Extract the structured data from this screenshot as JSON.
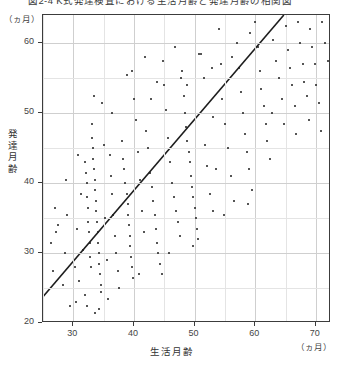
{
  "title": "図2-4  K式発達検査における生活月齢と発達月齢の相関図",
  "axes": {
    "x_label": "生活月齢",
    "x_unit": "（ヵ月）",
    "y_label": "発達月齢",
    "y_unit": "（ヵ月）",
    "x_ticks": [
      "30",
      "40",
      "50",
      "60",
      "70"
    ],
    "y_ticks": [
      "60",
      "50",
      "40",
      "30",
      "20"
    ]
  },
  "chart_data": {
    "type": "scatter",
    "title": "図2-4  K式発達検査における生活月齢と発達月齢の相関図",
    "xlabel": "生活月齢",
    "ylabel": "発達月齢",
    "x_unit": "ヵ月",
    "y_unit": "ヵ月",
    "xlim": [
      25,
      72.5
    ],
    "ylim": [
      20,
      64
    ],
    "xticks": [
      30,
      40,
      50,
      60,
      70
    ],
    "yticks": [
      20,
      30,
      40,
      50,
      60
    ],
    "grid": true,
    "grid_step_x": 5,
    "grid_step_y": 5,
    "legend": "none",
    "series": [
      {
        "name": "被検児",
        "marker": "dot",
        "color": "#1d1d1d",
        "points": [
          [
            26.3,
            31.5
          ],
          [
            26.6,
            27.5
          ],
          [
            27.0,
            36.5
          ],
          [
            27.2,
            33.0
          ],
          [
            28.3,
            25.5
          ],
          [
            28.6,
            30.0
          ],
          [
            29.0,
            35.5
          ],
          [
            29.4,
            22.5
          ],
          [
            30.2,
            28.0
          ],
          [
            30.6,
            33.5
          ],
          [
            31.0,
            26.0
          ],
          [
            31.2,
            38.5
          ],
          [
            31.6,
            30.5
          ],
          [
            31.9,
            24.0
          ],
          [
            32.0,
            43.0
          ],
          [
            32.1,
            41.5
          ],
          [
            32.2,
            40.0
          ],
          [
            32.3,
            38.0
          ],
          [
            32.4,
            36.5
          ],
          [
            32.5,
            34.5
          ],
          [
            32.6,
            33.0
          ],
          [
            32.7,
            31.5
          ],
          [
            32.8,
            29.5
          ],
          [
            32.9,
            28.0
          ],
          [
            33.0,
            48.5
          ],
          [
            33.1,
            46.5
          ],
          [
            33.2,
            45.0
          ],
          [
            33.3,
            43.5
          ],
          [
            33.4,
            42.0
          ],
          [
            33.5,
            40.5
          ],
          [
            33.6,
            39.0
          ],
          [
            33.7,
            37.5
          ],
          [
            33.8,
            36.0
          ],
          [
            33.9,
            34.5
          ],
          [
            34.0,
            33.0
          ],
          [
            34.1,
            31.5
          ],
          [
            34.2,
            30.0
          ],
          [
            34.3,
            28.5
          ],
          [
            34.4,
            27.0
          ],
          [
            34.5,
            25.5
          ],
          [
            34.6,
            24.5
          ],
          [
            35.0,
            45.5
          ],
          [
            35.3,
            35.0
          ],
          [
            35.6,
            29.0
          ],
          [
            36.0,
            44.0
          ],
          [
            36.2,
            41.0
          ],
          [
            36.4,
            38.5
          ],
          [
            36.6,
            35.5
          ],
          [
            36.8,
            32.5
          ],
          [
            37.0,
            30.0
          ],
          [
            37.3,
            27.5
          ],
          [
            37.6,
            25.0
          ],
          [
            38.0,
            46.0
          ],
          [
            38.2,
            43.5
          ],
          [
            38.4,
            42.0
          ],
          [
            38.6,
            40.0
          ],
          [
            38.8,
            38.5
          ],
          [
            39.0,
            37.0
          ],
          [
            39.1,
            35.5
          ],
          [
            39.2,
            34.0
          ],
          [
            39.3,
            32.5
          ],
          [
            39.4,
            31.0
          ],
          [
            39.5,
            29.5
          ],
          [
            39.6,
            28.0
          ],
          [
            39.8,
            26.5
          ],
          [
            40.0,
            52.0
          ],
          [
            40.3,
            49.0
          ],
          [
            40.6,
            44.5
          ],
          [
            41.0,
            40.5
          ],
          [
            41.3,
            36.0
          ],
          [
            41.6,
            33.0
          ],
          [
            42.0,
            47.5
          ],
          [
            42.3,
            45.0
          ],
          [
            42.6,
            41.5
          ],
          [
            43.0,
            39.5
          ],
          [
            43.2,
            37.5
          ],
          [
            43.4,
            35.5
          ],
          [
            43.6,
            33.5
          ],
          [
            43.8,
            31.5
          ],
          [
            44.0,
            30.0
          ],
          [
            44.3,
            28.5
          ],
          [
            44.6,
            27.0
          ],
          [
            45.0,
            54.0
          ],
          [
            45.3,
            50.5
          ],
          [
            45.6,
            46.5
          ],
          [
            46.0,
            43.0
          ],
          [
            46.3,
            40.0
          ],
          [
            46.6,
            38.0
          ],
          [
            47.0,
            36.0
          ],
          [
            47.3,
            34.5
          ],
          [
            47.6,
            32.5
          ],
          [
            48.0,
            56.0
          ],
          [
            48.2,
            52.5
          ],
          [
            48.4,
            50.0
          ],
          [
            48.6,
            48.0
          ],
          [
            48.8,
            46.0
          ],
          [
            49.0,
            44.5
          ],
          [
            49.2,
            43.0
          ],
          [
            49.4,
            41.0
          ],
          [
            49.6,
            39.5
          ],
          [
            49.8,
            38.0
          ],
          [
            50.0,
            36.5
          ],
          [
            50.2,
            35.0
          ],
          [
            50.4,
            33.5
          ],
          [
            50.6,
            32.0
          ],
          [
            51.0,
            58.5
          ],
          [
            51.5,
            55.0
          ],
          [
            52.0,
            42.5
          ],
          [
            52.5,
            38.5
          ],
          [
            53.0,
            36.0
          ],
          [
            53.5,
            42.0
          ],
          [
            54.0,
            62.0
          ],
          [
            54.3,
            57.0
          ],
          [
            54.6,
            52.0
          ],
          [
            55.0,
            48.5
          ],
          [
            55.5,
            45.0
          ],
          [
            56.0,
            41.0
          ],
          [
            56.5,
            37.5
          ],
          [
            57.0,
            60.0
          ],
          [
            57.3,
            56.5
          ],
          [
            57.6,
            53.0
          ],
          [
            58.0,
            50.0
          ],
          [
            58.3,
            47.0
          ],
          [
            58.6,
            44.5
          ],
          [
            59.0,
            42.0
          ],
          [
            59.5,
            39.0
          ],
          [
            60.0,
            63.0
          ],
          [
            60.4,
            59.5
          ],
          [
            60.8,
            56.0
          ],
          [
            61.0,
            53.5
          ],
          [
            61.4,
            51.0
          ],
          [
            61.8,
            48.5
          ],
          [
            62.0,
            46.0
          ],
          [
            62.5,
            43.5
          ],
          [
            63.0,
            60.5
          ],
          [
            63.5,
            57.5
          ],
          [
            64.0,
            55.0
          ],
          [
            64.5,
            52.0
          ],
          [
            65.0,
            62.5
          ],
          [
            65.4,
            59.0
          ],
          [
            65.8,
            56.5
          ],
          [
            66.0,
            54.0
          ],
          [
            66.5,
            51.0
          ],
          [
            67.0,
            63.0
          ],
          [
            67.4,
            60.0
          ],
          [
            67.8,
            57.0
          ],
          [
            68.0,
            54.5
          ],
          [
            68.5,
            52.5
          ],
          [
            69.0,
            62.0
          ],
          [
            69.4,
            59.5
          ],
          [
            69.8,
            57.0
          ],
          [
            70.0,
            54.0
          ],
          [
            70.5,
            51.5
          ],
          [
            71.0,
            63.0
          ],
          [
            71.5,
            60.0
          ],
          [
            72.0,
            57.5
          ],
          [
            53.0,
            49.5
          ],
          [
            51.8,
            45.5
          ],
          [
            47.8,
            55.0
          ],
          [
            44.8,
            57.5
          ],
          [
            42.8,
            52.0
          ],
          [
            38.8,
            55.5
          ],
          [
            36.4,
            50.0
          ],
          [
            34.8,
            51.5
          ],
          [
            33.4,
            52.5
          ],
          [
            30.8,
            44.0
          ],
          [
            28.8,
            40.5
          ],
          [
            27.4,
            34.0
          ],
          [
            59.2,
            61.5
          ],
          [
            56.2,
            58.0
          ],
          [
            50.8,
            58.5
          ],
          [
            46.8,
            59.5
          ],
          [
            41.8,
            58.0
          ],
          [
            39.6,
            56.0
          ],
          [
            43.8,
            54.5
          ],
          [
            48.8,
            54.0
          ],
          [
            52.8,
            56.5
          ],
          [
            62.8,
            50.0
          ],
          [
            64.8,
            48.5
          ],
          [
            66.8,
            47.0
          ],
          [
            68.8,
            49.0
          ],
          [
            70.8,
            47.5
          ],
          [
            58.8,
            37.0
          ],
          [
            54.8,
            35.5
          ],
          [
            49.8,
            31.0
          ],
          [
            45.8,
            30.0
          ],
          [
            40.8,
            27.0
          ],
          [
            35.8,
            23.5
          ],
          [
            32.2,
            22.5
          ],
          [
            30.4,
            23.0
          ],
          [
            33.6,
            21.5
          ],
          [
            34.2,
            22.0
          ]
        ]
      }
    ],
    "regression_line": {
      "name": "回帰直線",
      "color": "#1d1d1d",
      "from": [
        25.0,
        23.5
      ],
      "to": [
        65.0,
        64.0
      ]
    }
  }
}
